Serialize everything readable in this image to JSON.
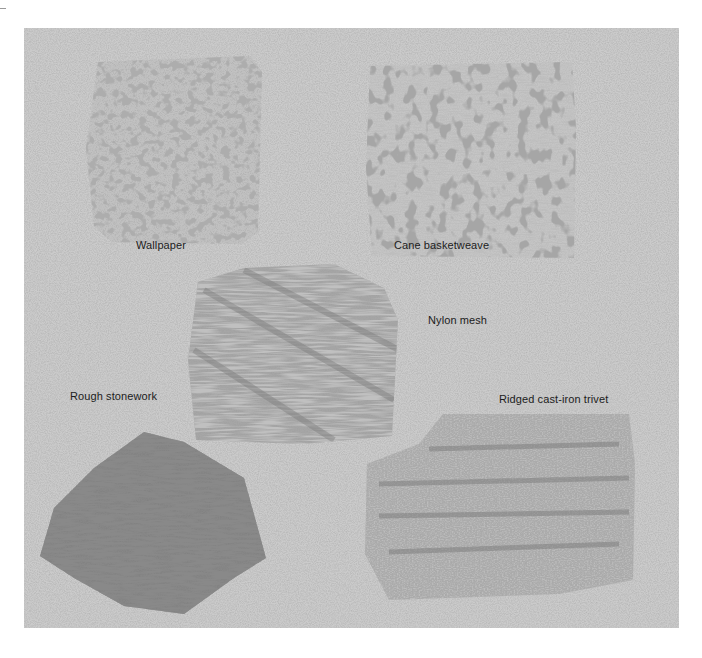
{
  "figure": {
    "background_color": "#c9c9c9",
    "swatches": [
      {
        "id": "wallpaper",
        "label": "Wallpaper",
        "tone": "#6e6e6e"
      },
      {
        "id": "cane-basketweave",
        "label": "Cane basketweave",
        "tone": "#6a6a6a"
      },
      {
        "id": "nylon-mesh",
        "label": "Nylon mesh",
        "tone": "#8a8a8a"
      },
      {
        "id": "rough-stonework",
        "label": "Rough stonework",
        "tone": "#4a4a4a"
      },
      {
        "id": "ridged-cast-iron-trivet",
        "label": "Ridged cast-iron trivet",
        "tone": "#8c8c8c"
      }
    ]
  }
}
